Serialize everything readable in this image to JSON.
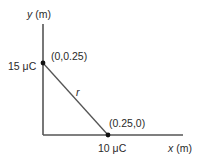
{
  "diagram": {
    "axes": {
      "y_label_var": "y",
      "y_label_unit": " (m)",
      "x_label_var": "x",
      "x_label_unit": " (m)"
    },
    "charges": [
      {
        "name": "charge-top",
        "charge_label": "15 μC",
        "coord_label": "(0,0.25)"
      },
      {
        "name": "charge-right",
        "charge_label": "10 μC",
        "coord_label": "(0.25,0)"
      }
    ],
    "separation_label": "r",
    "colors": {
      "line": "#555555",
      "dot": "#111111",
      "text": "#2a2a2a"
    }
  }
}
